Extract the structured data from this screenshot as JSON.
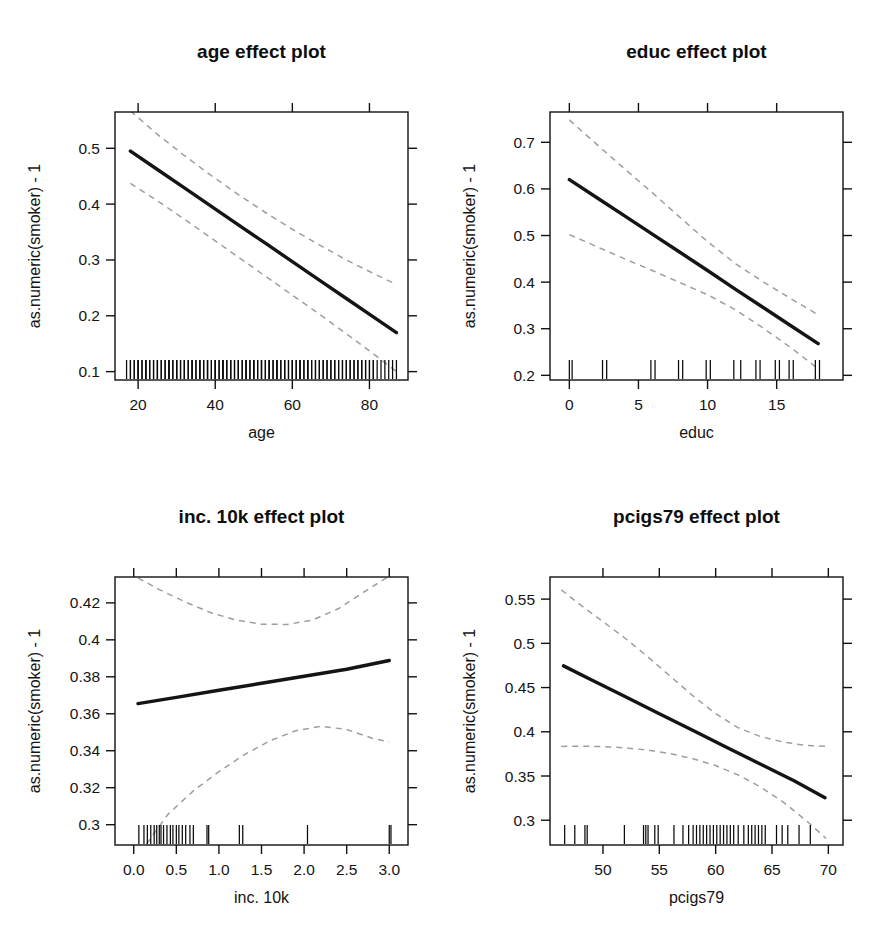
{
  "figure": {
    "background": "#ffffff",
    "line_color": "#141414",
    "ci_color": "#9e9e9e",
    "rug_color": "#0a0a0a",
    "layout": "2x2 grid of effect plots"
  },
  "chart_data": [
    {
      "type": "line",
      "title": "age effect plot",
      "xlabel": "age",
      "ylabel": "as.numeric(smoker) - 1",
      "xlim": [
        14,
        90
      ],
      "ylim": [
        0.085,
        0.565
      ],
      "grid": false,
      "legend": null,
      "xticks": [
        20,
        40,
        60,
        80
      ],
      "xticklabels": [
        "20",
        "40",
        "60",
        "80"
      ],
      "yticks": [
        0.1,
        0.2,
        0.3,
        0.4,
        0.5
      ],
      "yticklabels": [
        "0.1",
        "0.2",
        "0.3",
        "0.4",
        "0.5"
      ],
      "series": [
        {
          "name": "fit",
          "style": "solid",
          "x": [
            18,
            25,
            32,
            39,
            46,
            53,
            60,
            67,
            74,
            81,
            87
          ],
          "values": [
            0.495,
            0.462,
            0.429,
            0.396,
            0.363,
            0.33,
            0.297,
            0.264,
            0.231,
            0.198,
            0.17
          ]
        },
        {
          "name": "upper-confidence",
          "style": "dashed",
          "x": [
            18,
            25,
            32,
            39,
            46,
            53,
            60,
            67,
            74,
            81,
            87
          ],
          "values": [
            0.567,
            0.525,
            0.487,
            0.451,
            0.417,
            0.385,
            0.355,
            0.327,
            0.3,
            0.276,
            0.256
          ]
        },
        {
          "name": "lower-confidence",
          "style": "dashed",
          "x": [
            18,
            25,
            32,
            39,
            46,
            53,
            60,
            67,
            74,
            81,
            87
          ],
          "values": [
            0.437,
            0.406,
            0.373,
            0.339,
            0.305,
            0.271,
            0.237,
            0.203,
            0.168,
            0.132,
            0.1
          ]
        }
      ],
      "rug": [
        17,
        18,
        18,
        19,
        19,
        20,
        20,
        20,
        21,
        21,
        22,
        22,
        22,
        23,
        23,
        24,
        24,
        25,
        25,
        25,
        26,
        26,
        27,
        27,
        28,
        28,
        28,
        29,
        29,
        30,
        30,
        30,
        31,
        31,
        32,
        32,
        32,
        33,
        33,
        34,
        34,
        34,
        35,
        35,
        36,
        36,
        36,
        37,
        37,
        38,
        38,
        38,
        39,
        39,
        40,
        40,
        40,
        41,
        41,
        42,
        42,
        42,
        43,
        43,
        44,
        44,
        44,
        45,
        45,
        46,
        46,
        46,
        47,
        47,
        48,
        48,
        48,
        49,
        49,
        50,
        50,
        50,
        51,
        51,
        52,
        52,
        52,
        53,
        53,
        54,
        54,
        54,
        55,
        55,
        56,
        56,
        56,
        57,
        57,
        58,
        58,
        58,
        59,
        59,
        60,
        60,
        60,
        61,
        61,
        62,
        62,
        62,
        63,
        63,
        64,
        64,
        64,
        65,
        65,
        66,
        66,
        67,
        67,
        68,
        68,
        69,
        69,
        70,
        70,
        71,
        71,
        72,
        72,
        73,
        73,
        74,
        74,
        75,
        75,
        76,
        76,
        77,
        77,
        78,
        78,
        79,
        79,
        80,
        80,
        81,
        81,
        82,
        83,
        84,
        85,
        86,
        87
      ]
    },
    {
      "type": "line",
      "title": "educ effect plot",
      "xlabel": "educ",
      "ylabel": "as.numeric(smoker) - 1",
      "xlim": [
        -1.4,
        19.8
      ],
      "ylim": [
        0.19,
        0.765
      ],
      "grid": false,
      "legend": null,
      "xticks": [
        0,
        5,
        10,
        15
      ],
      "xticklabels": [
        "0",
        "5",
        "10",
        "15"
      ],
      "yticks": [
        0.2,
        0.3,
        0.4,
        0.5,
        0.6,
        0.7
      ],
      "yticklabels": [
        "0.2",
        "0.3",
        "0.4",
        "0.5",
        "0.6",
        "0.7"
      ],
      "series": [
        {
          "name": "fit",
          "style": "solid",
          "x": [
            0,
            2,
            4,
            6,
            8,
            10,
            12,
            14,
            16,
            18
          ],
          "values": [
            0.62,
            0.581,
            0.542,
            0.503,
            0.464,
            0.425,
            0.385,
            0.346,
            0.307,
            0.268
          ]
        },
        {
          "name": "upper-confidence",
          "style": "dashed",
          "x": [
            0,
            2,
            4,
            6,
            8,
            10,
            12,
            14,
            16,
            18
          ],
          "values": [
            0.748,
            0.695,
            0.643,
            0.592,
            0.539,
            0.487,
            0.44,
            0.401,
            0.365,
            0.33
          ]
        },
        {
          "name": "lower-confidence",
          "style": "dashed",
          "x": [
            0,
            2,
            4,
            6,
            8,
            10,
            12,
            14,
            16,
            18
          ],
          "values": [
            0.502,
            0.476,
            0.45,
            0.425,
            0.399,
            0.373,
            0.341,
            0.302,
            0.26,
            0.214
          ]
        }
      ],
      "rug": [
        0,
        0.2,
        2.4,
        2.7,
        5.9,
        6.2,
        7.9,
        8.2,
        9.9,
        10.2,
        11.9,
        12.4,
        13.5,
        13.8,
        14.9,
        15.2,
        15.9,
        16.2,
        17.8,
        18.1
      ]
    },
    {
      "type": "line",
      "title": "inc. 10k effect plot",
      "xlabel": "inc. 10k",
      "ylabel": "as.numeric(smoker) - 1",
      "xlim": [
        -0.22,
        3.22
      ],
      "ylim": [
        0.289,
        0.434
      ],
      "grid": false,
      "legend": null,
      "xticks": [
        0.0,
        0.5,
        1.0,
        1.5,
        2.0,
        2.5,
        3.0
      ],
      "xticklabels": [
        "0.0",
        "0.5",
        "1.0",
        "1.5",
        "2.0",
        "2.5",
        "3.0"
      ],
      "yticks": [
        0.3,
        0.32,
        0.34,
        0.36,
        0.38,
        0.4,
        0.42
      ],
      "yticklabels": [
        "0.3",
        "0.32",
        "0.34",
        "0.36",
        "0.38",
        "0.4",
        "0.42"
      ],
      "series": [
        {
          "name": "fit",
          "style": "solid",
          "x": [
            0.05,
            0.5,
            1.0,
            1.5,
            2.0,
            2.5,
            3.0
          ],
          "values": [
            0.3655,
            0.3689,
            0.3727,
            0.3765,
            0.3803,
            0.3841,
            0.3888
          ]
        },
        {
          "name": "upper-confidence",
          "style": "dashed",
          "x": [
            0.05,
            0.3,
            0.6,
            0.9,
            1.2,
            1.5,
            1.8,
            2.1,
            2.4,
            2.7,
            3.0
          ],
          "values": [
            0.4335,
            0.4272,
            0.4206,
            0.4148,
            0.4107,
            0.4085,
            0.4083,
            0.4107,
            0.4168,
            0.4258,
            0.4345
          ]
        },
        {
          "name": "lower-confidence",
          "style": "dashed",
          "x": [
            0.15,
            0.4,
            0.7,
            1.0,
            1.3,
            1.6,
            1.9,
            2.2,
            2.5,
            2.8,
            3.0
          ],
          "values": [
            0.2895,
            0.3055,
            0.3183,
            0.3287,
            0.3379,
            0.3454,
            0.3508,
            0.3532,
            0.3515,
            0.3468,
            0.3447
          ]
        }
      ],
      "rug": [
        0.06,
        0.12,
        0.16,
        0.2,
        0.24,
        0.27,
        0.3,
        0.32,
        0.35,
        0.39,
        0.43,
        0.46,
        0.5,
        0.53,
        0.57,
        0.61,
        0.66,
        0.7,
        0.86,
        0.88,
        1.24,
        1.28,
        2.04,
        3.0,
        3.02
      ]
    },
    {
      "type": "line",
      "title": "pcigs79 effect plot",
      "xlabel": "pcigs79",
      "ylabel": "as.numeric(smoker) - 1",
      "xlim": [
        45.3,
        71.3
      ],
      "ylim": [
        0.272,
        0.575
      ],
      "grid": false,
      "legend": null,
      "xticks": [
        50,
        55,
        60,
        65,
        70
      ],
      "xticklabels": [
        "50",
        "55",
        "60",
        "65",
        "70"
      ],
      "yticks": [
        0.3,
        0.35,
        0.4,
        0.45,
        0.5,
        0.55
      ],
      "yticklabels": [
        "0.3",
        "0.35",
        "0.4",
        "0.45",
        "0.5",
        "0.55"
      ],
      "series": [
        {
          "name": "fit",
          "style": "solid",
          "x": [
            46.5,
            49,
            52,
            55,
            58,
            61,
            64,
            67,
            69.7
          ],
          "values": [
            0.4745,
            0.4585,
            0.4395,
            0.4205,
            0.4015,
            0.3823,
            0.3633,
            0.3443,
            0.3255
          ]
        },
        {
          "name": "upper-confidence",
          "style": "dashed",
          "x": [
            46.3,
            48,
            50,
            52,
            54,
            56,
            58,
            60,
            62,
            64,
            66,
            68,
            70
          ],
          "values": [
            0.5605,
            0.5435,
            0.5245,
            0.5055,
            0.4845,
            0.4625,
            0.4405,
            0.4205,
            0.4045,
            0.3945,
            0.3885,
            0.3845,
            0.3835
          ]
        },
        {
          "name": "lower-confidence",
          "style": "dashed",
          "x": [
            46.3,
            48,
            50,
            52,
            54,
            56,
            58,
            60,
            62,
            64,
            66,
            68,
            69.8
          ],
          "values": [
            0.3835,
            0.3837,
            0.3833,
            0.3818,
            0.3793,
            0.3752,
            0.3695,
            0.3618,
            0.3512,
            0.3375,
            0.3205,
            0.3,
            0.2795
          ]
        }
      ],
      "rug": [
        46.6,
        47.5,
        48.4,
        48.6,
        51.9,
        53.6,
        53.8,
        54.0,
        54.6,
        54.9,
        56.3,
        57.1,
        57.6,
        58.0,
        58.3,
        58.6,
        58.9,
        59.2,
        59.5,
        59.8,
        60.1,
        60.4,
        60.7,
        61.0,
        61.3,
        61.6,
        62.0,
        62.5,
        62.9,
        63.2,
        63.5,
        63.8,
        64.1,
        64.4,
        65.4,
        65.9,
        66.4,
        67.4,
        68.4
      ]
    }
  ]
}
